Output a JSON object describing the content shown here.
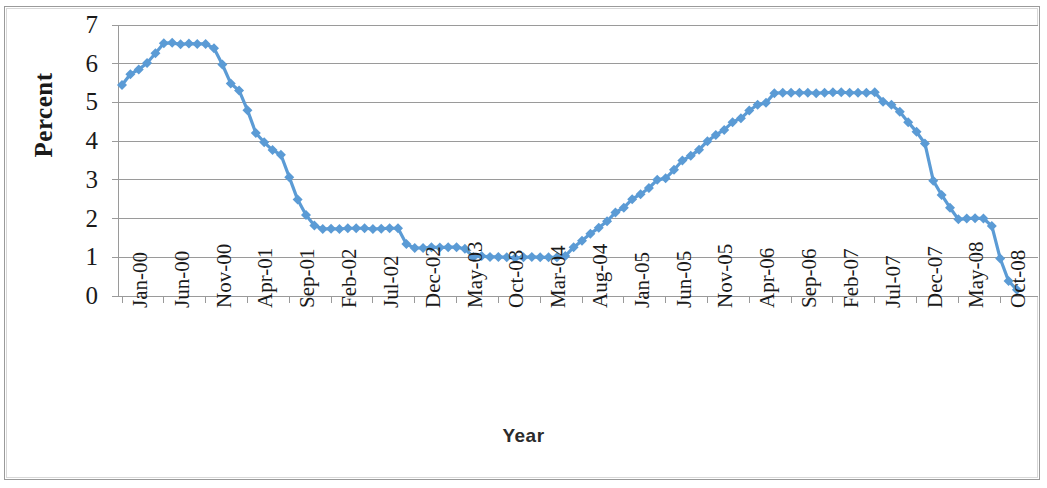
{
  "chart_data": {
    "type": "line",
    "title": "",
    "xlabel": "Year",
    "ylabel": "Percent",
    "ylim": [
      0,
      7
    ],
    "ytick_values": [
      0,
      1,
      2,
      3,
      4,
      5,
      6,
      7
    ],
    "ytick_labels": [
      "0",
      "1",
      "2",
      "3",
      "4",
      "5",
      "6",
      "7"
    ],
    "grid": true,
    "legend": "none",
    "series_color": "#5B9BD5",
    "marker": "diamond",
    "marker_color": "#5B9BD5",
    "x_tick_labels": [
      "Jan-00",
      "Jun-00",
      "Nov-00",
      "Apr-01",
      "Sep-01",
      "Feb-02",
      "Jul-02",
      "Dec-02",
      "May-03",
      "Oct-03",
      "Mar-04",
      "Aug-04",
      "Jan-05",
      "Jun-05",
      "Nov-05",
      "Apr-06",
      "Sep-06",
      "Feb-07",
      "Jul-07",
      "Dec-07",
      "May-08",
      "Oct-08"
    ],
    "x_tick_interval_months": 5,
    "x_start_label": "Jan-00",
    "x_end_label": "Dec-08",
    "x_all_labels": [
      "Jan-00",
      "Feb-00",
      "Mar-00",
      "Apr-00",
      "May-00",
      "Jun-00",
      "Jul-00",
      "Aug-00",
      "Sep-00",
      "Oct-00",
      "Nov-00",
      "Dec-00",
      "Jan-01",
      "Feb-01",
      "Mar-01",
      "Apr-01",
      "May-01",
      "Jun-01",
      "Jul-01",
      "Aug-01",
      "Sep-01",
      "Oct-01",
      "Nov-01",
      "Dec-01",
      "Jan-02",
      "Feb-02",
      "Mar-02",
      "Apr-02",
      "May-02",
      "Jun-02",
      "Jul-02",
      "Aug-02",
      "Sep-02",
      "Oct-02",
      "Nov-02",
      "Dec-02",
      "Jan-03",
      "Feb-03",
      "Mar-03",
      "Apr-03",
      "May-03",
      "Jun-03",
      "Jul-03",
      "Aug-03",
      "Sep-03",
      "Oct-03",
      "Nov-03",
      "Dec-03",
      "Jan-04",
      "Feb-04",
      "Mar-04",
      "Apr-04",
      "May-04",
      "Jun-04",
      "Jul-04",
      "Aug-04",
      "Sep-04",
      "Oct-04",
      "Nov-04",
      "Dec-04",
      "Jan-05",
      "Feb-05",
      "Mar-05",
      "Apr-05",
      "May-05",
      "Jun-05",
      "Jul-05",
      "Aug-05",
      "Sep-05",
      "Oct-05",
      "Nov-05",
      "Dec-05",
      "Jan-06",
      "Feb-06",
      "Mar-06",
      "Apr-06",
      "May-06",
      "Jun-06",
      "Jul-06",
      "Aug-06",
      "Sep-06",
      "Oct-06",
      "Nov-06",
      "Dec-06",
      "Jan-07",
      "Feb-07",
      "Mar-07",
      "Apr-07",
      "May-07",
      "Jun-07",
      "Jul-07",
      "Aug-07",
      "Sep-07",
      "Oct-07",
      "Nov-07",
      "Dec-07",
      "Jan-08",
      "Feb-08",
      "Mar-08",
      "Apr-08",
      "May-08",
      "Jun-08",
      "Jul-08",
      "Aug-08",
      "Sep-08",
      "Oct-08",
      "Nov-08",
      "Dec-08"
    ],
    "values": [
      5.45,
      5.73,
      5.85,
      6.02,
      6.27,
      6.53,
      6.54,
      6.5,
      6.52,
      6.51,
      6.51,
      6.4,
      5.98,
      5.49,
      5.31,
      4.8,
      4.21,
      3.97,
      3.77,
      3.65,
      3.07,
      2.49,
      2.09,
      1.82,
      1.73,
      1.74,
      1.73,
      1.75,
      1.75,
      1.75,
      1.73,
      1.74,
      1.75,
      1.75,
      1.34,
      1.24,
      1.24,
      1.26,
      1.25,
      1.26,
      1.26,
      1.22,
      1.01,
      1.03,
      1.01,
      1.01,
      1.0,
      0.98,
      1.0,
      1.01,
      1.0,
      1.0,
      1.0,
      1.03,
      1.26,
      1.43,
      1.61,
      1.76,
      1.93,
      2.16,
      2.28,
      2.5,
      2.63,
      2.79,
      3.0,
      3.04,
      3.26,
      3.5,
      3.62,
      3.78,
      4.0,
      4.16,
      4.29,
      4.49,
      4.59,
      4.79,
      4.94,
      4.99,
      5.24,
      5.25,
      5.25,
      5.25,
      5.25,
      5.24,
      5.25,
      5.26,
      5.26,
      5.25,
      5.25,
      5.25,
      5.26,
      5.02,
      4.94,
      4.76,
      4.49,
      4.24,
      3.94,
      2.98,
      2.61,
      2.28,
      1.98,
      2.0,
      2.01,
      2.0,
      1.81,
      0.97,
      0.39,
      0.16
    ],
    "notable_points": [
      {
        "label": "start",
        "x": "Jan-00",
        "y": 5.45
      },
      {
        "label": "peak",
        "x": "Jul-00",
        "y": 6.54
      },
      {
        "label": "trough-2003",
        "x": "Dec-03",
        "y": 0.98
      },
      {
        "label": "plateau-2006-2007",
        "x": "Jul-06",
        "y": 5.25
      },
      {
        "label": "end",
        "x": "Dec-08",
        "y": 0.16
      }
    ]
  },
  "axis": {
    "y_title": "Percent",
    "x_title": "Year"
  }
}
